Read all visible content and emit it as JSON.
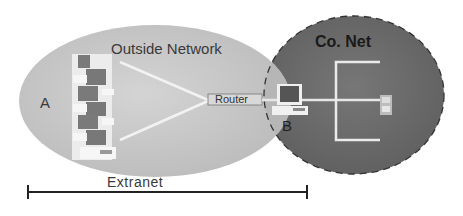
{
  "diagram": {
    "outside_network": {
      "label": "Outside Network",
      "fill": "#c8c8c8"
    },
    "co_net": {
      "label": "Co. Net",
      "fill": "#6e6e6e"
    },
    "node_a": {
      "label": "A"
    },
    "node_b": {
      "label": "B"
    },
    "router": {
      "label": "Router"
    },
    "extranet": {
      "label": "Extranet"
    }
  }
}
